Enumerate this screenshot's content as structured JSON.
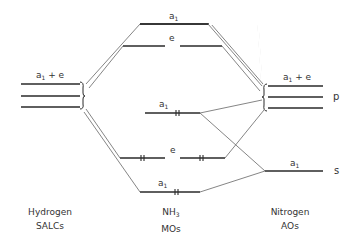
{
  "diagram": {
    "columns": {
      "left": {
        "line1": "Hydrogen",
        "line2": "SALCs"
      },
      "center": {
        "line1": "NH",
        "line1_sub": "3",
        "line2": "MOs"
      },
      "right": {
        "line1": "Nitrogen",
        "line2": "AOs"
      }
    },
    "left_levels": {
      "label": "a1 + e",
      "label_main": "a",
      "label_sub": "1",
      "label_rest": " + e"
    },
    "right_p_levels": {
      "label_main": "a",
      "label_sub": "1",
      "label_rest": " + e",
      "ao": "p"
    },
    "right_s_level": {
      "label_main": "a",
      "label_sub": "1",
      "ao": "s"
    },
    "mo_levels": [
      {
        "id": "a1-antibonding",
        "sym_main": "a",
        "sym_sub": "1",
        "electrons": 0
      },
      {
        "id": "e-antibonding",
        "sym_main": "e",
        "sym_sub": "",
        "electrons": 0
      },
      {
        "id": "a1-nonbonding",
        "sym_main": "a",
        "sym_sub": "1",
        "electrons": 2
      },
      {
        "id": "e-bonding",
        "sym_main": "e",
        "sym_sub": "",
        "electrons": 4
      },
      {
        "id": "a1-bonding",
        "sym_main": "a",
        "sym_sub": "1",
        "electrons": 2
      }
    ],
    "colors": {
      "line": "#2a2a2a",
      "connector": "#666666"
    }
  }
}
